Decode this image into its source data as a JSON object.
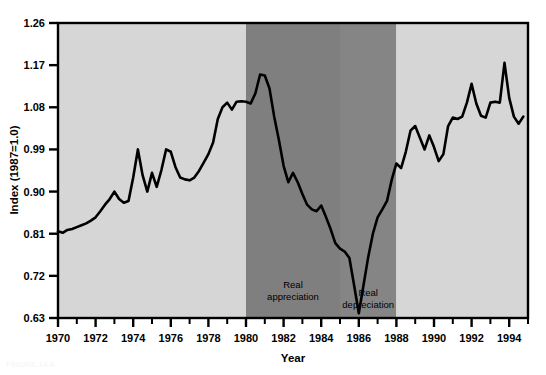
{
  "figure": {
    "background": "#ffffff",
    "plot": {
      "left": 58,
      "top": 23,
      "right": 528,
      "bottom": 318,
      "frame_color": "#000000"
    }
  },
  "axes": {
    "y": {
      "title": "Index (1987=1.0)",
      "ticks": [
        "0.63",
        "0.72",
        "0.81",
        "0.90",
        "0.99",
        "1.08",
        "1.17",
        "1.26"
      ],
      "min": 0.63,
      "max": 1.26
    },
    "x": {
      "title": "Year",
      "ticks": [
        "1970",
        "1972",
        "1974",
        "1976",
        "1978",
        "1980",
        "1982",
        "1984",
        "1986",
        "1988",
        "1990",
        "1992",
        "1994"
      ],
      "min": 1970,
      "max": 1995
    }
  },
  "regions": [
    {
      "name": "pre-period",
      "label": "",
      "start": 1970,
      "end": 1980,
      "color": "#d6d6d6"
    },
    {
      "name": "real-appreciation",
      "label_line1": "Real",
      "label_line2": "appreciation",
      "start": 1980,
      "end": 1985,
      "color": "#7f7f7f"
    },
    {
      "name": "real-depreciation",
      "label_line1": "Real",
      "label_line2": "depreciation",
      "start": 1985,
      "end": 1988,
      "color": "#858585"
    },
    {
      "name": "post-period",
      "label": "",
      "start": 1988,
      "end": 1995,
      "color": "#d6d6d6"
    }
  ],
  "caption": "FIGURE 14-8",
  "chart_data": {
    "type": "line",
    "title": "",
    "xlabel": "Year",
    "ylabel": "Index (1987=1.0)",
    "xlim": [
      1970,
      1995
    ],
    "ylim": [
      0.63,
      1.26
    ],
    "grid": false,
    "legend": "none",
    "line_color": "#000000",
    "line_width": 2.6,
    "annotations": [
      {
        "text": "Real appreciation",
        "x_range": [
          1980,
          1985
        ]
      },
      {
        "text": "Real depreciation",
        "x_range": [
          1985,
          1988
        ]
      }
    ],
    "series": [
      {
        "name": "Real exchange rate index",
        "x": [
          1970.0,
          1970.25,
          1970.5,
          1970.75,
          1971.0,
          1971.25,
          1971.5,
          1971.75,
          1972.0,
          1972.25,
          1972.5,
          1972.75,
          1973.0,
          1973.25,
          1973.5,
          1973.75,
          1974.0,
          1974.25,
          1974.5,
          1974.75,
          1975.0,
          1975.25,
          1975.5,
          1975.75,
          1976.0,
          1976.25,
          1976.5,
          1976.75,
          1977.0,
          1977.25,
          1977.5,
          1977.75,
          1978.0,
          1978.25,
          1978.5,
          1978.75,
          1979.0,
          1979.25,
          1979.5,
          1979.75,
          1980.0,
          1980.25,
          1980.5,
          1980.75,
          1981.0,
          1981.25,
          1981.5,
          1981.75,
          1982.0,
          1982.25,
          1982.5,
          1982.75,
          1983.0,
          1983.25,
          1983.5,
          1983.75,
          1984.0,
          1984.25,
          1984.5,
          1984.75,
          1985.0,
          1985.25,
          1985.5,
          1985.75,
          1986.0,
          1986.25,
          1986.5,
          1986.75,
          1987.0,
          1987.25,
          1987.5,
          1987.75,
          1988.0,
          1988.25,
          1988.5,
          1988.75,
          1989.0,
          1989.25,
          1989.5,
          1989.75,
          1990.0,
          1990.25,
          1990.5,
          1990.75,
          1991.0,
          1991.25,
          1991.5,
          1991.75,
          1992.0,
          1992.25,
          1992.5,
          1992.75,
          1993.0,
          1993.25,
          1993.5,
          1993.75,
          1994.0,
          1994.25,
          1994.5,
          1994.75
        ],
        "y": [
          0.815,
          0.812,
          0.818,
          0.82,
          0.824,
          0.828,
          0.832,
          0.838,
          0.845,
          0.858,
          0.872,
          0.884,
          0.9,
          0.884,
          0.876,
          0.88,
          0.93,
          0.99,
          0.935,
          0.9,
          0.94,
          0.91,
          0.946,
          0.99,
          0.985,
          0.952,
          0.93,
          0.926,
          0.924,
          0.93,
          0.944,
          0.962,
          0.98,
          1.005,
          1.055,
          1.08,
          1.09,
          1.075,
          1.092,
          1.093,
          1.092,
          1.088,
          1.11,
          1.15,
          1.148,
          1.12,
          1.06,
          1.01,
          0.955,
          0.92,
          0.94,
          0.92,
          0.895,
          0.872,
          0.862,
          0.858,
          0.87,
          0.846,
          0.82,
          0.79,
          0.778,
          0.772,
          0.758,
          0.7,
          0.64,
          0.7,
          0.76,
          0.81,
          0.845,
          0.862,
          0.88,
          0.925,
          0.96,
          0.95,
          0.985,
          1.03,
          1.04,
          1.015,
          0.99,
          1.02,
          0.995,
          0.965,
          0.98,
          1.04,
          1.058,
          1.055,
          1.06,
          1.09,
          1.13,
          1.088,
          1.062,
          1.058,
          1.09,
          1.092,
          1.09,
          1.175,
          1.1,
          1.06,
          1.045,
          1.06
        ]
      }
    ]
  }
}
